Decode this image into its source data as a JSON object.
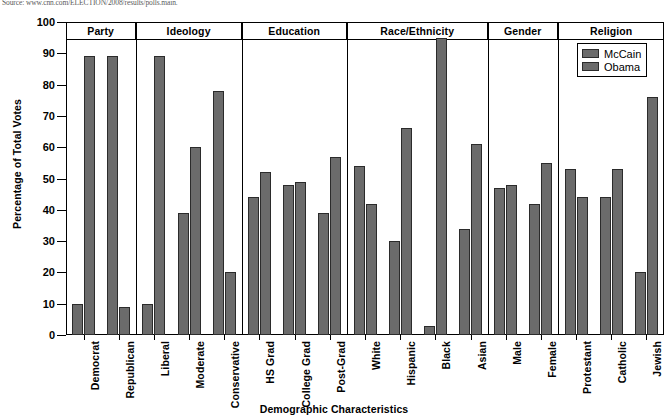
{
  "source_note": "Source: www.cnn.com/ELECTION/2008/results/polls.main.",
  "legend": {
    "position": "top-right",
    "entries": [
      {
        "name": "McCain",
        "color": "#6b6b6b"
      },
      {
        "name": "Obama",
        "color": "#6b6b6b"
      }
    ]
  },
  "axes": {
    "ylabel": "Percentage of Total Votes",
    "xlabel": "Demographic Characteristics",
    "yticks": [
      0,
      10,
      20,
      30,
      40,
      50,
      60,
      70,
      80,
      90,
      100
    ],
    "ylim": [
      0,
      100
    ]
  },
  "groups": [
    {
      "name": "Party",
      "categories": [
        "Democrat",
        "Republican"
      ]
    },
    {
      "name": "Ideology",
      "categories": [
        "Liberal",
        "Moderate",
        "Conservative"
      ]
    },
    {
      "name": "Education",
      "categories": [
        "HS Grad",
        "College Grad",
        "Post-Grad"
      ]
    },
    {
      "name": "Race/Ethnicity",
      "categories": [
        "White",
        "Hispanic",
        "Black",
        "Asian"
      ]
    },
    {
      "name": "Gender",
      "categories": [
        "Male",
        "Female"
      ]
    },
    {
      "name": "Religion",
      "categories": [
        "Protestant",
        "Catholic",
        "Jewish"
      ]
    }
  ],
  "chart_data": {
    "type": "bar",
    "title": "",
    "subtitle": "",
    "xlabel": "Demographic Characteristics",
    "ylabel": "Percentage of Total Votes",
    "ylim": [
      0,
      100
    ],
    "yticks": [
      0,
      10,
      20,
      30,
      40,
      50,
      60,
      70,
      80,
      90,
      100
    ],
    "grid": false,
    "legend_position": "top-right",
    "grouping": "grouped bars separated into demographic panels",
    "categories": [
      "Democrat",
      "Republican",
      "Liberal",
      "Moderate",
      "Conservative",
      "HS Grad",
      "College Grad",
      "Post-Grad",
      "White",
      "Hispanic",
      "Black",
      "Asian",
      "Male",
      "Female",
      "Protestant",
      "Catholic",
      "Jewish"
    ],
    "panels": [
      {
        "name": "Party",
        "categories": [
          "Democrat",
          "Republican"
        ]
      },
      {
        "name": "Ideology",
        "categories": [
          "Liberal",
          "Moderate",
          "Conservative"
        ]
      },
      {
        "name": "Education",
        "categories": [
          "HS Grad",
          "College Grad",
          "Post-Grad"
        ]
      },
      {
        "name": "Race/Ethnicity",
        "categories": [
          "White",
          "Hispanic",
          "Black",
          "Asian"
        ]
      },
      {
        "name": "Gender",
        "categories": [
          "Male",
          "Female"
        ]
      },
      {
        "name": "Religion",
        "categories": [
          "Protestant",
          "Catholic",
          "Jewish"
        ]
      }
    ],
    "series": [
      {
        "name": "McCain",
        "color": "#6b6b6b",
        "values": [
          10,
          89,
          10,
          39,
          78,
          44,
          48,
          39,
          54,
          30,
          3,
          34,
          47,
          42,
          53,
          44,
          20
        ]
      },
      {
        "name": "Obama",
        "color": "#6b6b6b",
        "values": [
          89,
          9,
          89,
          60,
          20,
          52,
          49,
          57,
          42,
          66,
          95,
          61,
          48,
          55,
          44,
          53,
          76
        ]
      }
    ],
    "annotations": [
      "Source: www.cnn.com/ELECTION/2008/results/polls.main."
    ]
  }
}
